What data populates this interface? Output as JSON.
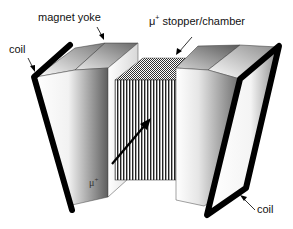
{
  "figure": {
    "labels": {
      "magnet_yoke": "magnet yoke",
      "stopper_prefix": "μ",
      "stopper_sup": "+",
      "stopper_suffix": " stopper/chamber",
      "coil_left": "coil",
      "coil_right": "coil",
      "muon_prefix": "μ",
      "muon_sup": "+"
    },
    "colors": {
      "background": "#ffffff",
      "coil": "#000000",
      "block_light": "#ffffff",
      "block_dark": "#6a6a6a",
      "hatch": "#222222",
      "text": "#111111"
    },
    "components": [
      {
        "name": "left-magnet-yoke",
        "position": "left"
      },
      {
        "name": "left-coil",
        "position": "left-outer"
      },
      {
        "name": "muon-stopper-chamber",
        "position": "center",
        "pattern": "vertical-plates"
      },
      {
        "name": "right-magnet-yoke",
        "position": "right"
      },
      {
        "name": "right-coil",
        "position": "right-outer"
      },
      {
        "name": "muon-beam-arrow",
        "position": "center",
        "direction": "up-right"
      }
    ]
  }
}
